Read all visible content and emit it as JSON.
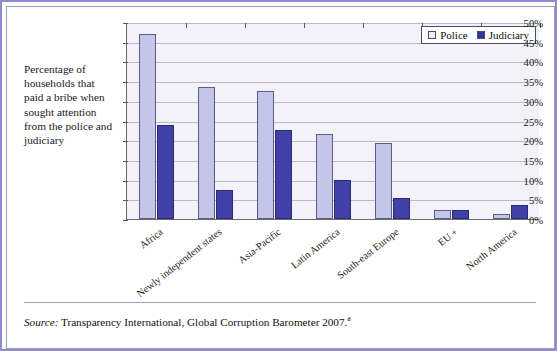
{
  "caption": {
    "text": "Percentage of households that paid a bribe when sought attention from the police and judiciary"
  },
  "legend": {
    "position": "top-right",
    "entries": [
      {
        "label": "Police",
        "color": "#c3c6e8",
        "swatch": "police-swatch"
      },
      {
        "label": "Judiciary",
        "color": "#4040a8",
        "swatch": "judiciary-swatch"
      }
    ]
  },
  "source": {
    "prefix": "Source:",
    "text": " Transparency International, Global Corruption Barometer 2007.",
    "footnote": "a"
  },
  "chart_data": {
    "type": "bar",
    "title": "",
    "subtitle": "",
    "xlabel": "",
    "ylabel": "",
    "ylim": [
      0,
      50
    ],
    "ytick_labels": [
      "0%",
      "5%",
      "10%",
      "15%",
      "20%",
      "25%",
      "30%",
      "35%",
      "40%",
      "45%",
      "50%"
    ],
    "ytick_values": [
      0,
      5,
      10,
      15,
      20,
      25,
      30,
      35,
      40,
      45,
      50
    ],
    "grid": true,
    "legend_position": "top-right",
    "categories": [
      "Africa",
      "Newly independent states",
      "Asia-Pacific",
      "Latin America",
      "South-east Europe",
      "EU +",
      "North America"
    ],
    "series": [
      {
        "name": "Police",
        "color": "#c3c6e8",
        "values": [
          47.0,
          33.6,
          32.4,
          21.6,
          19.4,
          2.3,
          1.3
        ]
      },
      {
        "name": "Judiciary",
        "color": "#4040a8",
        "values": [
          23.8,
          7.4,
          22.7,
          9.9,
          5.3,
          2.3,
          3.6
        ]
      }
    ]
  }
}
